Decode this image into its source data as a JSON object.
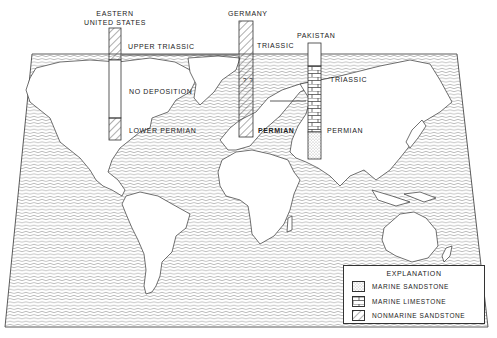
{
  "figure": {
    "caption_fragment": "",
    "background_pattern": "wavy-ocean-lines",
    "colors": {
      "ink": "#222222",
      "paper": "#ffffff",
      "ocean_lines": "#555555"
    }
  },
  "columns": [
    {
      "title_line1": "EASTERN",
      "title_line2": "UNITED STATES",
      "labels": {
        "top": "UPPER TRIASSIC",
        "middle": "NO DEPOSITION",
        "bottom": "LOWER PERMIAN"
      },
      "segments": [
        "nonmarine-sandstone",
        "no-deposition",
        "nonmarine-sandstone"
      ]
    },
    {
      "title_line1": "GERMANY",
      "labels": {
        "top": "TRIASSIC",
        "bottom": "PERMIAN"
      },
      "marks": "? ?",
      "segments": [
        "nonmarine-sandstone"
      ]
    },
    {
      "title_line1": "PAKISTAN",
      "labels": {
        "top": "TRIASSIC",
        "bottom": "PERMIAN"
      },
      "segments": [
        "blank",
        "marine-limestone",
        "marine-sandstone"
      ]
    }
  ],
  "legend": {
    "title": "EXPLANATION",
    "items": [
      {
        "pattern": "marine-sandstone",
        "label": "MARINE SANDSTONE"
      },
      {
        "pattern": "marine-limestone",
        "label": "MARINE LIMESTONE"
      },
      {
        "pattern": "nonmarine-sandstone",
        "label": "NONMARINE SANDSTONE"
      }
    ]
  }
}
